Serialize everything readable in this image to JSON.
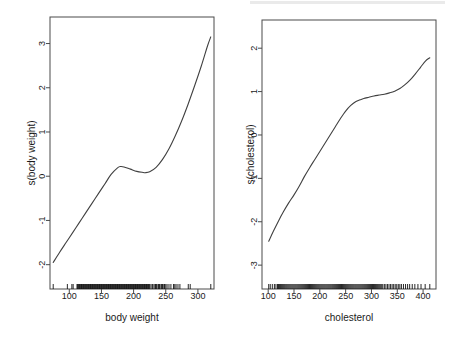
{
  "figure": {
    "width": 458,
    "height": 346,
    "background": "#ffffff",
    "line_color": "#404040",
    "axis_color": "#4a4a4a",
    "text_color": "#1a1a1a"
  },
  "chart_data": [
    {
      "type": "line",
      "panel": "left",
      "title": "",
      "xlabel": "body weight",
      "ylabel": "s(body weight)",
      "xlim": [
        70,
        325
      ],
      "ylim": [
        -2.55,
        3.6
      ],
      "xticks": [
        100,
        150,
        200,
        250,
        300
      ],
      "yticks": [
        -2,
        -1,
        0,
        1,
        2,
        3
      ],
      "xtick_labels": [
        "100",
        "150",
        "200",
        "250",
        "300"
      ],
      "ytick_labels": [
        "-2",
        "-1",
        "0",
        "1",
        "2",
        "3"
      ],
      "grid": false,
      "legend": "none",
      "rug": true,
      "x": [
        75,
        85,
        95,
        105,
        115,
        125,
        135,
        145,
        155,
        165,
        175,
        180,
        185,
        195,
        205,
        215,
        218,
        225,
        235,
        245,
        255,
        265,
        275,
        285,
        295,
        305,
        315,
        320
      ],
      "y": [
        -1.95,
        -1.72,
        -1.5,
        -1.28,
        -1.06,
        -0.84,
        -0.62,
        -0.4,
        -0.18,
        0.04,
        0.19,
        0.22,
        0.21,
        0.16,
        0.11,
        0.085,
        0.08,
        0.1,
        0.2,
        0.38,
        0.62,
        0.92,
        1.26,
        1.64,
        2.05,
        2.48,
        2.95,
        3.15
      ],
      "rug_values": [
        75,
        97,
        104,
        106,
        112,
        113,
        114,
        115,
        116,
        117,
        118,
        119,
        120,
        121,
        122,
        123,
        124,
        125,
        126,
        127,
        128,
        129,
        130,
        131,
        132,
        133,
        134,
        135,
        136,
        137,
        138,
        139,
        140,
        141,
        142,
        143,
        144,
        145,
        146,
        147,
        148,
        149,
        150,
        151,
        152,
        153,
        154,
        155,
        156,
        157,
        158,
        159,
        160,
        161,
        162,
        163,
        164,
        165,
        166,
        167,
        168,
        169,
        170,
        171,
        172,
        173,
        174,
        175,
        176,
        177,
        178,
        179,
        180,
        181,
        182,
        183,
        184,
        185,
        186,
        187,
        188,
        189,
        190,
        191,
        192,
        193,
        194,
        195,
        196,
        197,
        198,
        199,
        200,
        201,
        202,
        203,
        204,
        205,
        206,
        207,
        208,
        209,
        210,
        211,
        212,
        213,
        214,
        215,
        216,
        217,
        218,
        219,
        220,
        221,
        222,
        223,
        224,
        225,
        227,
        229,
        230,
        232,
        234,
        235,
        236,
        238,
        239,
        240,
        241,
        243,
        244,
        245,
        247,
        248,
        250,
        252,
        255,
        258,
        262,
        264,
        266,
        269,
        272,
        285,
        288,
        320
      ]
    },
    {
      "type": "line",
      "panel": "right",
      "title": "",
      "xlabel": "cholesterol",
      "ylabel": "s(cholesterol)",
      "xlim": [
        88,
        425
      ],
      "ylim": [
        -3.55,
        2.65
      ],
      "xticks": [
        100,
        150,
        200,
        250,
        300,
        350,
        400
      ],
      "yticks": [
        -3,
        -2,
        -1,
        0,
        1,
        2
      ],
      "xtick_labels": [
        "100",
        "150",
        "200",
        "250",
        "300",
        "350",
        "400"
      ],
      "ytick_labels": [
        "-3",
        "-2",
        "-1",
        "0",
        "1",
        "2"
      ],
      "grid": false,
      "legend": "none",
      "rug": true,
      "x": [
        101,
        110,
        120,
        130,
        140,
        150,
        160,
        170,
        180,
        190,
        200,
        210,
        220,
        230,
        240,
        250,
        260,
        270,
        280,
        285,
        295,
        305,
        315,
        325,
        335,
        345,
        355,
        365,
        375,
        385,
        395,
        405,
        413
      ],
      "y": [
        -2.45,
        -2.22,
        -1.98,
        -1.76,
        -1.56,
        -1.38,
        -1.18,
        -0.96,
        -0.76,
        -0.57,
        -0.38,
        -0.19,
        0.0,
        0.19,
        0.38,
        0.55,
        0.68,
        0.77,
        0.82,
        0.84,
        0.87,
        0.9,
        0.92,
        0.94,
        0.97,
        1.01,
        1.07,
        1.16,
        1.27,
        1.41,
        1.56,
        1.71,
        1.78
      ],
      "rug_values": [
        101,
        104,
        108,
        112,
        115,
        118,
        120,
        122,
        124,
        126,
        128,
        130,
        132,
        134,
        136,
        138,
        140,
        142,
        144,
        146,
        148,
        150,
        152,
        154,
        156,
        158,
        160,
        162,
        164,
        166,
        168,
        170,
        172,
        174,
        176,
        178,
        180,
        182,
        184,
        186,
        188,
        190,
        192,
        194,
        196,
        198,
        200,
        202,
        204,
        206,
        208,
        210,
        212,
        214,
        216,
        218,
        220,
        222,
        224,
        226,
        228,
        230,
        232,
        234,
        236,
        238,
        240,
        242,
        244,
        246,
        248,
        250,
        252,
        254,
        256,
        258,
        260,
        262,
        264,
        266,
        268,
        270,
        272,
        274,
        276,
        278,
        280,
        282,
        284,
        286,
        288,
        290,
        292,
        294,
        296,
        298,
        300,
        302,
        304,
        306,
        308,
        310,
        312,
        314,
        316,
        318,
        320,
        322,
        325,
        328,
        331,
        334,
        337,
        340,
        343,
        346,
        349,
        352,
        355,
        358,
        362,
        366,
        370,
        374,
        379,
        384,
        390,
        396,
        404,
        413
      ]
    }
  ]
}
